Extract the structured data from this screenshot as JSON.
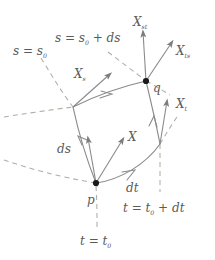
{
  "figure": {
    "colors": {
      "background": "#ffffff",
      "stroke_solid": "#8a8a8a",
      "stroke_dashed": "#b0a9a0",
      "point_fill": "#1a1a1a",
      "text": "#5a5a5a"
    }
  },
  "points": [
    {
      "id": "p",
      "label": "p",
      "x": 96,
      "y": 183
    },
    {
      "id": "q",
      "label": "q",
      "x": 146,
      "y": 81
    }
  ],
  "coordinate_curves": [
    {
      "id": "s0",
      "label": "s = s",
      "sub": "0",
      "tail": ""
    },
    {
      "id": "s0ds",
      "label": "s = s",
      "sub": "0",
      "tail": " + ds"
    },
    {
      "id": "t0",
      "label": "t = t",
      "sub": "0",
      "tail": ""
    },
    {
      "id": "t0dt",
      "label": "t = t",
      "sub": "0",
      "tail": " + dt"
    }
  ],
  "labels": {
    "s_eq_s0": {
      "main": "s = s",
      "sub": "0",
      "tail": ""
    },
    "s_eq_s0_ds": {
      "main": "s = s",
      "sub": "0",
      "tail": " + ds"
    },
    "t_eq_t0": {
      "main": "t = t",
      "sub": "0",
      "tail": ""
    },
    "t_eq_t0_dt": {
      "main": "t = t",
      "sub": "0",
      "tail": " + dt"
    },
    "X_s": {
      "main": "X",
      "sub": "s"
    },
    "X_t": {
      "main": "X",
      "sub": "t"
    },
    "X_st": {
      "main": "X",
      "sub": "st"
    },
    "X_ts": {
      "main": "X",
      "sub": "ts"
    },
    "X": {
      "main": "X",
      "sub": ""
    },
    "ds": {
      "main": "ds",
      "sub": ""
    },
    "dt": {
      "main": "dt",
      "sub": ""
    },
    "p": {
      "main": "p",
      "sub": ""
    },
    "q": {
      "main": "q",
      "sub": ""
    }
  },
  "vectors": [
    {
      "id": "X_s",
      "from": "left-vertex",
      "direction": "up-right"
    },
    {
      "id": "X_st",
      "from": "q",
      "direction": "up"
    },
    {
      "id": "X_ts",
      "from": "q",
      "direction": "up-right"
    },
    {
      "id": "X_t",
      "from": "right-vertex",
      "direction": "up"
    },
    {
      "id": "X",
      "from": "p",
      "direction": "up-right"
    },
    {
      "id": "ds",
      "from": "p",
      "direction": "up"
    },
    {
      "id": "dt",
      "from": "p",
      "direction": "right"
    }
  ]
}
